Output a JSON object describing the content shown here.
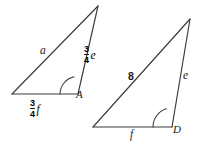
{
  "figure": {
    "type": "geometry-diagram",
    "background_color": "#ffffff",
    "stroke_color": "#3a3a3a",
    "text_color": "#1b1b1b",
    "width": 207,
    "height": 146
  },
  "triangles": [
    {
      "id": "left-triangle",
      "vertices": {
        "apex": {
          "x": 98,
          "y": 6
        },
        "bottom_left": {
          "x": 12,
          "y": 94
        },
        "bottom_right": {
          "x": 78,
          "y": 94
        }
      },
      "vertex_label": "A",
      "angle_marked_at": "bottom_right",
      "labels": {
        "hypotenuse": "a",
        "right_side_numerator": "3",
        "right_side_denominator": "4",
        "right_side_variable": "e",
        "base_numerator": "3",
        "base_denominator": "4",
        "base_variable": "f"
      }
    },
    {
      "id": "right-triangle",
      "vertices": {
        "apex": {
          "x": 190,
          "y": 19
        },
        "bottom_left": {
          "x": 93,
          "y": 127
        },
        "bottom_right": {
          "x": 172,
          "y": 127
        }
      },
      "vertex_label": "D",
      "angle_marked_at": "bottom_right",
      "labels": {
        "hypotenuse": "8",
        "right_side_variable": "e",
        "base_variable": "f"
      }
    }
  ]
}
